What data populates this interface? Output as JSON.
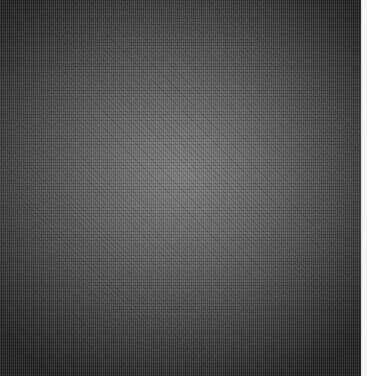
{
  "image": {
    "description": "Gray textured radial gradient surface",
    "colors": {
      "center": "#7b7b7b",
      "corners": "#262626",
      "right_edge_strip": "#f4f4f4"
    }
  }
}
